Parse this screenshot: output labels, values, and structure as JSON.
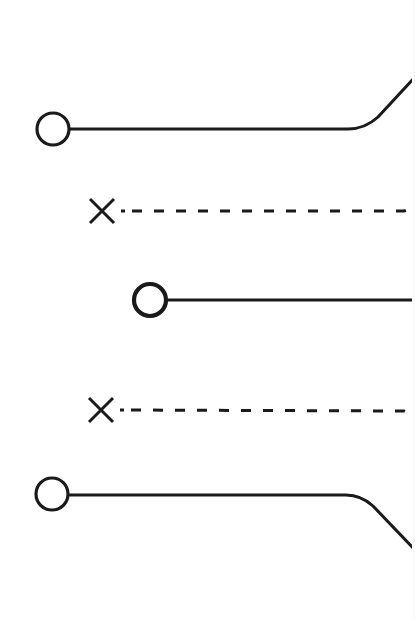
{
  "diagram": {
    "colors": {
      "background": "#ffffff",
      "stroke": "#1a1a1a"
    },
    "elements": [
      {
        "id": "terminal-1",
        "type": "circle-terminal",
        "cx": 53,
        "cy": 129,
        "r": 16,
        "line": "solid",
        "path_end": "curves-up-right"
      },
      {
        "id": "nc-1",
        "type": "x-marker",
        "cx": 102,
        "cy": 211,
        "line": "dashed",
        "path_end": "curves-up-right"
      },
      {
        "id": "terminal-2",
        "type": "circle-terminal",
        "cx": 150,
        "cy": 300,
        "r": 16,
        "line": "solid",
        "path_end": "straight"
      },
      {
        "id": "nc-2",
        "type": "x-marker",
        "cx": 101,
        "cy": 410,
        "line": "dashed",
        "path_end": "curves-down-right"
      },
      {
        "id": "terminal-3",
        "type": "circle-terminal",
        "cx": 52,
        "cy": 494,
        "r": 16,
        "line": "solid",
        "path_end": "curves-down-right"
      }
    ]
  }
}
